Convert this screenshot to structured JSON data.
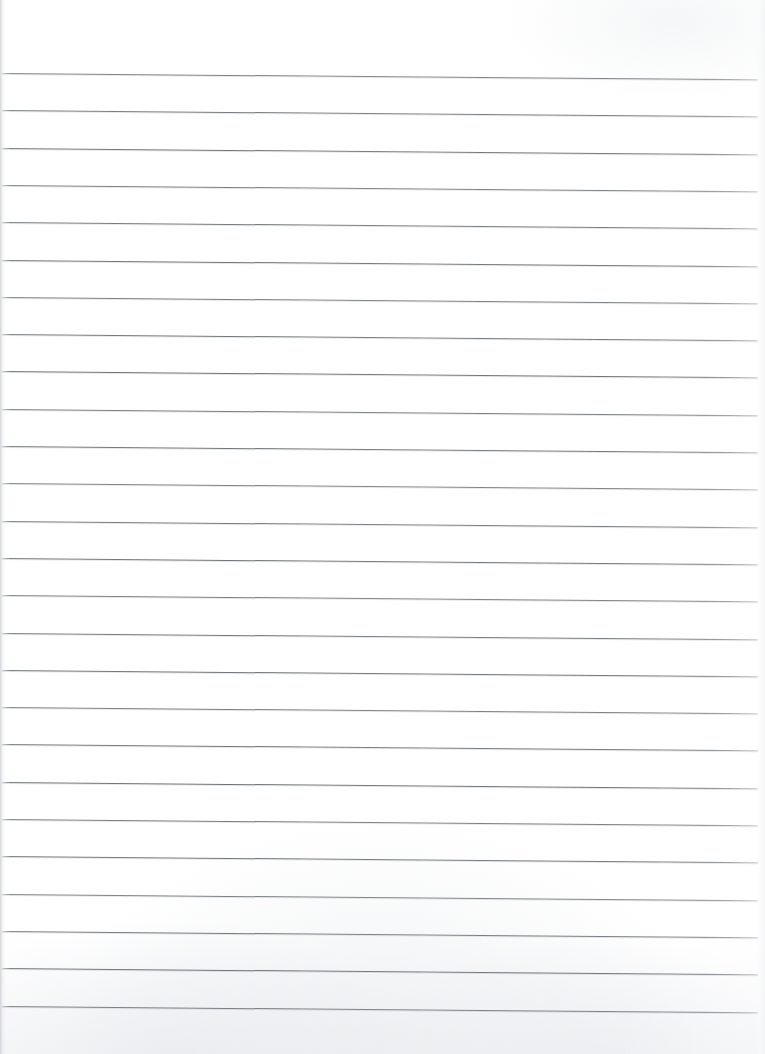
{
  "document": {
    "kind": "scanned-lined-notebook-page",
    "title": "Blank Ruled Notebook Page",
    "content_text": "",
    "page_width": 765,
    "page_height": 1054,
    "paper_color": "#ffffff",
    "texture_color": "#f7f8f9"
  },
  "ruling": {
    "line_color": "#6f7479",
    "line_thickness_px": 1,
    "line_count": 26,
    "first_line_y": 73,
    "line_spacing_px": 37.3,
    "line_start_x": 2,
    "line_end_x": 758,
    "skew_degrees": 0.48,
    "positions_y": [
      73,
      110.3,
      147.6,
      184.9,
      222.2,
      259.5,
      296.8,
      334.1,
      371.4,
      408.7,
      446,
      483.3,
      520.6,
      557.9,
      595.2,
      632.5,
      669.8,
      707.1,
      744.4,
      781.7,
      819,
      856.3,
      893.6,
      930.9,
      968.2,
      1005.5
    ]
  },
  "edges": {
    "left_edge_color": "#c4c8cd",
    "left_edge_width_px": 6,
    "right_edge_color": "#f3f4f6",
    "right_edge_width_px": 10
  }
}
